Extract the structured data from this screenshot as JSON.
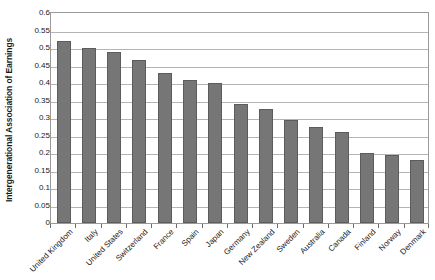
{
  "chart_data": {
    "type": "bar",
    "title": "",
    "xlabel": "",
    "ylabel": "Intergenerational Association of Earnings",
    "ylim": [
      0,
      0.6
    ],
    "ytick_labels": [
      "0.6",
      "0.55",
      "0.5",
      "0.45",
      "0.4",
      "0.35",
      "0.3",
      "0.25",
      "0.2",
      "0.15",
      "0.1",
      "0.05",
      "0"
    ],
    "ytick_values": [
      0.6,
      0.55,
      0.5,
      0.45,
      0.4,
      0.35,
      0.3,
      0.25,
      0.2,
      0.15,
      0.1,
      0.05,
      0
    ],
    "grid": true,
    "legend": "none",
    "bar_color": "#767676",
    "bar_border_color": "#5c5c5c",
    "categories": [
      "United Kingdom",
      "Italy",
      "United States",
      "Switzerland",
      "France",
      "Spain",
      "Japan",
      "Germany",
      "New Zealand",
      "Sweden",
      "Australia",
      "Canada",
      "Finland",
      "Norway",
      "Denmark"
    ],
    "values": [
      0.52,
      0.5,
      0.49,
      0.465,
      0.43,
      0.41,
      0.4,
      0.34,
      0.325,
      0.295,
      0.275,
      0.26,
      0.2,
      0.195,
      0.18
    ]
  }
}
